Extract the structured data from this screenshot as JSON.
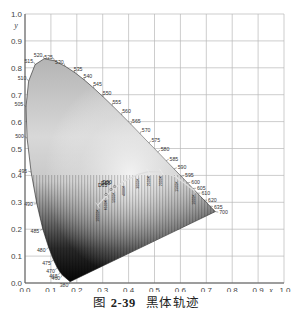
{
  "caption": {
    "prefix": "图",
    "number": "2-39",
    "title": "黑体轨迹"
  },
  "chart_data": {
    "type": "scatter",
    "xlabel": "x",
    "ylabel": "y",
    "xlim": [
      0.0,
      1.0
    ],
    "ylim": [
      0.0,
      1.0
    ],
    "grid": true,
    "x_ticks": [
      "0.0",
      "0.1",
      "0.2",
      "0.3",
      "0.4",
      "0.5",
      "0.6",
      "0.7",
      "0.8",
      "0.9",
      "1.0"
    ],
    "y_ticks": [
      "0.0",
      "0.1",
      "0.2",
      "0.3",
      "0.4",
      "0.5",
      "0.6",
      "0.7",
      "0.8",
      "0.9",
      "1.0"
    ],
    "spectral_locus": {
      "wavelength_labels": [
        "380",
        "460",
        "465",
        "470",
        "475",
        "480",
        "485",
        "490",
        "495",
        "500",
        "505",
        "510",
        "515",
        "520",
        "525",
        "530",
        "535",
        "540",
        "545",
        "550",
        "555",
        "560",
        "565",
        "570",
        "575",
        "580",
        "585",
        "590",
        "595",
        "600",
        "605",
        "610",
        "620",
        "635",
        "700"
      ],
      "points": [
        {
          "nm": "380",
          "x": 0.1741,
          "y": 0.005
        },
        {
          "nm": "460",
          "x": 0.144,
          "y": 0.0297
        },
        {
          "nm": "465",
          "x": 0.1355,
          "y": 0.0399
        },
        {
          "nm": "470",
          "x": 0.1241,
          "y": 0.0578
        },
        {
          "nm": "475",
          "x": 0.1096,
          "y": 0.0868
        },
        {
          "nm": "480",
          "x": 0.0913,
          "y": 0.1327
        },
        {
          "nm": "485",
          "x": 0.0687,
          "y": 0.2007
        },
        {
          "nm": "490",
          "x": 0.0454,
          "y": 0.295
        },
        {
          "nm": "495",
          "x": 0.0235,
          "y": 0.4127
        },
        {
          "nm": "500",
          "x": 0.0082,
          "y": 0.5384
        },
        {
          "nm": "505",
          "x": 0.0039,
          "y": 0.6548
        },
        {
          "nm": "510",
          "x": 0.0139,
          "y": 0.7502
        },
        {
          "nm": "515",
          "x": 0.0389,
          "y": 0.812
        },
        {
          "nm": "520",
          "x": 0.0743,
          "y": 0.8338
        },
        {
          "nm": "525",
          "x": 0.1142,
          "y": 0.8262
        },
        {
          "nm": "530",
          "x": 0.1547,
          "y": 0.8059
        },
        {
          "nm": "535",
          "x": 0.1929,
          "y": 0.7816
        },
        {
          "nm": "540",
          "x": 0.2296,
          "y": 0.7543
        },
        {
          "nm": "545",
          "x": 0.2658,
          "y": 0.7243
        },
        {
          "nm": "550",
          "x": 0.3016,
          "y": 0.6923
        },
        {
          "nm": "555",
          "x": 0.3373,
          "y": 0.6589
        },
        {
          "nm": "560",
          "x": 0.3731,
          "y": 0.6245
        },
        {
          "nm": "565",
          "x": 0.4087,
          "y": 0.5896
        },
        {
          "nm": "570",
          "x": 0.4441,
          "y": 0.5547
        },
        {
          "nm": "575",
          "x": 0.4788,
          "y": 0.5202
        },
        {
          "nm": "580",
          "x": 0.5125,
          "y": 0.4866
        },
        {
          "nm": "585",
          "x": 0.5448,
          "y": 0.4544
        },
        {
          "nm": "590",
          "x": 0.5752,
          "y": 0.4242
        },
        {
          "nm": "595",
          "x": 0.6029,
          "y": 0.3965
        },
        {
          "nm": "600",
          "x": 0.627,
          "y": 0.3725
        },
        {
          "nm": "605",
          "x": 0.6482,
          "y": 0.3514
        },
        {
          "nm": "610",
          "x": 0.6658,
          "y": 0.334
        },
        {
          "nm": "620",
          "x": 0.6915,
          "y": 0.3083
        },
        {
          "nm": "635",
          "x": 0.714,
          "y": 0.2859
        },
        {
          "nm": "700",
          "x": 0.7347,
          "y": 0.2653
        }
      ]
    },
    "blackbody_locus": {
      "labels": [
        "D50",
        "D55",
        "D65",
        "1000K",
        "1500K",
        "2000K",
        "2500K",
        "3000K",
        "4000K",
        "5000K",
        "6500K",
        "10000K"
      ],
      "points": [
        {
          "T": "1000K",
          "x": 0.6528,
          "y": 0.3444
        },
        {
          "T": "1500K",
          "x": 0.5857,
          "y": 0.3931
        },
        {
          "T": "2000K",
          "x": 0.5267,
          "y": 0.4133
        },
        {
          "T": "2500K",
          "x": 0.477,
          "y": 0.4137
        },
        {
          "T": "3000K",
          "x": 0.4369,
          "y": 0.4041
        },
        {
          "T": "4000K",
          "x": 0.3805,
          "y": 0.3768
        },
        {
          "T": "5000K",
          "x": 0.3451,
          "y": 0.3516
        },
        {
          "T": "6500K",
          "x": 0.3135,
          "y": 0.3236
        },
        {
          "T": "10000K",
          "x": 0.2807,
          "y": 0.2884
        }
      ],
      "illuminants": [
        {
          "name": "D50",
          "x": 0.3457,
          "y": 0.3585
        },
        {
          "name": "D55",
          "x": 0.3324,
          "y": 0.3474
        },
        {
          "name": "D65",
          "x": 0.3127,
          "y": 0.329
        }
      ]
    }
  }
}
